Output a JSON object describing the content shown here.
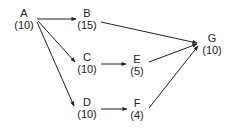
{
  "diagram": {
    "type": "activity-network",
    "nodes": [
      {
        "id": "A",
        "label": "A",
        "value": "(10)",
        "x": 24,
        "y": 13
      },
      {
        "id": "B",
        "label": "B",
        "value": "(15)",
        "x": 87,
        "y": 13
      },
      {
        "id": "C",
        "label": "C",
        "value": "(10)",
        "x": 87,
        "y": 58
      },
      {
        "id": "D",
        "label": "D",
        "value": "(10)",
        "x": 87,
        "y": 102
      },
      {
        "id": "E",
        "label": "E",
        "value": "(5)",
        "x": 137,
        "y": 59
      },
      {
        "id": "F",
        "label": "F",
        "value": "(4)",
        "x": 137,
        "y": 103
      },
      {
        "id": "G",
        "label": "G",
        "value": "(10)",
        "x": 212,
        "y": 38
      }
    ],
    "edges": [
      {
        "from": "A",
        "to": "B"
      },
      {
        "from": "A",
        "to": "C"
      },
      {
        "from": "A",
        "to": "D"
      },
      {
        "from": "B",
        "to": "G"
      },
      {
        "from": "C",
        "to": "E"
      },
      {
        "from": "D",
        "to": "F"
      },
      {
        "from": "E",
        "to": "G"
      },
      {
        "from": "F",
        "to": "G"
      }
    ]
  }
}
